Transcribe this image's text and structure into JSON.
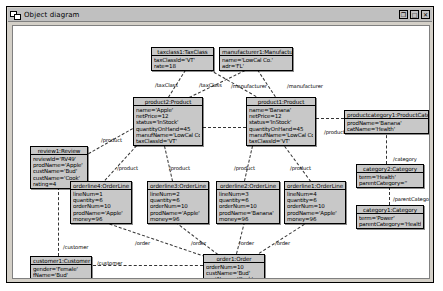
{
  "window": {
    "title": "Object diagram",
    "icon": "object-diagram-icon",
    "buttons": [
      {
        "name": "restore-button",
        "glyph": "❐"
      },
      {
        "name": "maximize-button",
        "glyph": "□"
      },
      {
        "name": "close-button",
        "glyph": "✕"
      }
    ]
  },
  "objects": [
    {
      "id": "taxclass1",
      "header": "taxclass1:TaxClass",
      "attributes": [
        "taxClassId='VT'",
        "rate=18"
      ],
      "x": 138,
      "y": 21,
      "w": 63
    },
    {
      "id": "manufacturer1",
      "header": "manufacturer1:Manufacturer",
      "attributes": [
        "name='LowCal Co.'",
        "adr='FL'"
      ],
      "x": 206,
      "y": 21,
      "w": 74
    },
    {
      "id": "product2",
      "header": "product2:Product",
      "attributes": [
        "name='Apple'",
        "netPrice=12",
        "status='InStock'",
        "quantityOnHand=45",
        "manufName='LowCal Co.'",
        "taxClassId='VT'"
      ],
      "x": 120,
      "y": 71,
      "w": 70
    },
    {
      "id": "product1",
      "header": "product1:Product",
      "attributes": [
        "name='Banana'",
        "netPrice=12",
        "status='InStock'",
        "quantityOnHand=45",
        "manufName='LowCal Co.'",
        "taxClassId='VT'"
      ],
      "x": 233,
      "y": 71,
      "w": 70
    },
    {
      "id": "productcategory1",
      "header": "productcategory1:ProductCategory",
      "attributes": [
        "prodName='Banana'",
        "catName='Health'"
      ],
      "x": 331,
      "y": 84,
      "w": 85
    },
    {
      "id": "category2",
      "header": "category2:Category",
      "attributes": [
        "term='Health'",
        "parentCategory=''"
      ],
      "x": 343,
      "y": 138,
      "w": 68
    },
    {
      "id": "category1",
      "header": "category1:Category",
      "attributes": [
        "term='Power'",
        "parentCategory='Health'"
      ],
      "x": 343,
      "y": 179,
      "w": 68
    },
    {
      "id": "review1",
      "header": "review1:Review",
      "attributes": [
        "reviewId='RV49'",
        "prodName='Apple'",
        "custName='Bud'",
        "custName='Cook'",
        "rating=4"
      ],
      "x": 17,
      "y": 120,
      "w": 58
    },
    {
      "id": "orderline4",
      "header": "orderline4:OrderLine",
      "attributes": [
        "lineNum=1",
        "quantity=6",
        "orderNum=10",
        "prodName='Apple'",
        "money=96"
      ],
      "x": 57,
      "y": 155,
      "w": 62
    },
    {
      "id": "orderline3",
      "header": "orderline3:OrderLine",
      "attributes": [
        "lineNum=2",
        "quantity=6",
        "orderNum=10",
        "prodName='Apple'",
        "money=96"
      ],
      "x": 134,
      "y": 155,
      "w": 62
    },
    {
      "id": "orderline2",
      "header": "orderline2:OrderLine",
      "attributes": [
        "lineNum=3",
        "quantity=6",
        "orderNum=10",
        "prodName='Banana'",
        "money=96"
      ],
      "x": 203,
      "y": 155,
      "w": 64
    },
    {
      "id": "orderline1",
      "header": "orderline1:OrderLine",
      "attributes": [
        "lineNum=4",
        "quantity=6",
        "orderNum=10",
        "prodName='Apple'",
        "money=96"
      ],
      "x": 271,
      "y": 155,
      "w": 62
    },
    {
      "id": "order1",
      "header": "order1:Order",
      "attributes": [
        "orderNum=10",
        "custName='Bud'",
        "custName='Cook'",
        "date='FEB-02'"
      ],
      "x": 190,
      "y": 228,
      "w": 62
    },
    {
      "id": "customer1",
      "header": "customer1:Customer",
      "attributes": [
        "gender='Female'",
        "fName='Bud'",
        "lName='Cook'"
      ],
      "x": 17,
      "y": 230,
      "w": 62
    }
  ],
  "links": [
    {
      "name": "link-product2-taxclass1",
      "x1": 155,
      "y1": 71,
      "x2": 172,
      "y2": 44
    },
    {
      "name": "link-product1-taxclass1",
      "x1": 243,
      "y1": 71,
      "x2": 196,
      "y2": 44
    },
    {
      "name": "link-product2-manufacturer1",
      "x1": 176,
      "y1": 71,
      "x2": 232,
      "y2": 44
    },
    {
      "name": "link-product1-manufacturer1",
      "x1": 262,
      "y1": 71,
      "x2": 244,
      "y2": 44
    },
    {
      "name": "link-product2-review1",
      "x1": 120,
      "y1": 103,
      "x2": 76,
      "y2": 128
    },
    {
      "name": "link-product2-orderline4",
      "x1": 124,
      "y1": 120,
      "x2": 92,
      "y2": 155
    },
    {
      "name": "link-product2-orderline3",
      "x1": 152,
      "y1": 120,
      "x2": 160,
      "y2": 155
    },
    {
      "name": "link-product1-orderline2",
      "x1": 240,
      "y1": 120,
      "x2": 232,
      "y2": 155
    },
    {
      "name": "link-product1-orderline1",
      "x1": 272,
      "y1": 120,
      "x2": 298,
      "y2": 155
    },
    {
      "name": "link-product2-product1-mid",
      "x1": 190,
      "y1": 101,
      "x2": 233,
      "y2": 101
    },
    {
      "name": "link-product1-productcategory1",
      "x1": 303,
      "y1": 92,
      "x2": 331,
      "y2": 92
    },
    {
      "name": "link-productcategory1-category2",
      "x1": 374,
      "y1": 104,
      "x2": 374,
      "y2": 138
    },
    {
      "name": "link-category2-category1",
      "x1": 377,
      "y1": 161,
      "x2": 377,
      "y2": 179
    },
    {
      "name": "link-orderline4-order1",
      "x1": 92,
      "y1": 196,
      "x2": 192,
      "y2": 230
    },
    {
      "name": "link-orderline3-order1",
      "x1": 163,
      "y1": 196,
      "x2": 205,
      "y2": 228
    },
    {
      "name": "link-orderline2-order1",
      "x1": 232,
      "y1": 196,
      "x2": 224,
      "y2": 228
    },
    {
      "name": "link-orderline1-order1",
      "x1": 296,
      "y1": 196,
      "x2": 246,
      "y2": 228
    },
    {
      "name": "link-order1-customer1",
      "x1": 190,
      "y1": 240,
      "x2": 80,
      "y2": 240
    },
    {
      "name": "link-review1-customer1",
      "x1": 46,
      "y1": 161,
      "x2": 46,
      "y2": 230
    }
  ],
  "link_labels": [
    {
      "name": "label-taxclass-left",
      "text": "/taxClass",
      "x": 142,
      "y": 56
    },
    {
      "name": "label-taxclass-right",
      "text": "/taxClass",
      "x": 186,
      "y": 56
    },
    {
      "name": "label-manufacturer-left",
      "text": "/manufacturer",
      "x": 218,
      "y": 57
    },
    {
      "name": "label-manufacturer-right",
      "text": "/manufacturer",
      "x": 274,
      "y": 57
    },
    {
      "name": "label-product-review",
      "text": "/product",
      "x": 88,
      "y": 111
    },
    {
      "name": "label-product-ol4",
      "text": "/product",
      "x": 104,
      "y": 139
    },
    {
      "name": "label-product-ol3",
      "text": "/product",
      "x": 156,
      "y": 139
    },
    {
      "name": "label-product-ol2",
      "text": "/product",
      "x": 221,
      "y": 139
    },
    {
      "name": "label-product-ol1",
      "text": "/product",
      "x": 277,
      "y": 139
    },
    {
      "name": "label-product-right",
      "text": "/product",
      "x": 311,
      "y": 103
    },
    {
      "name": "label-category",
      "text": "/category",
      "x": 380,
      "y": 130
    },
    {
      "name": "label-parentcategory",
      "text": "/parentCategory",
      "x": 380,
      "y": 170
    },
    {
      "name": "label-order-ol4",
      "text": "/order",
      "x": 122,
      "y": 214
    },
    {
      "name": "label-order-ol3",
      "text": "/order",
      "x": 178,
      "y": 214
    },
    {
      "name": "label-order-ol2",
      "text": "/order",
      "x": 226,
      "y": 214
    },
    {
      "name": "label-order-ol1",
      "text": "/order",
      "x": 262,
      "y": 214
    },
    {
      "name": "label-customer-top",
      "text": "/customer",
      "x": 50,
      "y": 218
    },
    {
      "name": "label-customer-order",
      "text": "/customer",
      "x": 84,
      "y": 234
    }
  ]
}
